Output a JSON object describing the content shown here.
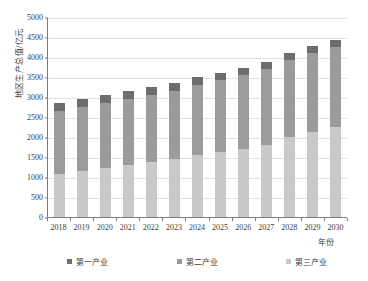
{
  "chart_data": {
    "type": "bar",
    "stacked": true,
    "title": "",
    "xlabel": "年份",
    "ylabel": "地区生产总值/亿元",
    "ylim": [
      0,
      5000
    ],
    "ytick_step": 500,
    "yticks": [
      0,
      500,
      1000,
      1500,
      2000,
      2500,
      3000,
      3500,
      4000,
      4500,
      5000
    ],
    "categories": [
      "2018",
      "2019",
      "2020",
      "2021",
      "2022",
      "2023",
      "2024",
      "2025",
      "2026",
      "2027",
      "2028",
      "2029",
      "2030"
    ],
    "grid": true,
    "legend_position": "bottom",
    "series": [
      {
        "name": "第一产业",
        "color": "#6d6d6d",
        "stack_order": 3,
        "values": [
          200,
          200,
          195,
          195,
          190,
          190,
          190,
          185,
          185,
          185,
          180,
          180,
          180
        ]
      },
      {
        "name": "第二产业",
        "color": "#9b9b9b",
        "stack_order": 2,
        "values": [
          1575,
          1600,
          1625,
          1660,
          1680,
          1710,
          1760,
          1790,
          1830,
          1880,
          1930,
          1975,
          1995
        ]
      },
      {
        "name": "第三产业",
        "color": "#c9c9c9",
        "stack_order": 1,
        "values": [
          1075,
          1150,
          1230,
          1295,
          1380,
          1450,
          1550,
          1625,
          1710,
          1810,
          1990,
          2120,
          2250
        ]
      }
    ],
    "totals": [
      2850,
      2950,
      3050,
      3150,
      3250,
      3350,
      3500,
      3600,
      3725,
      3875,
      4100,
      4275,
      4425
    ]
  },
  "axis": {
    "y_title": "地区生产总值/亿元",
    "x_title": "年份"
  }
}
